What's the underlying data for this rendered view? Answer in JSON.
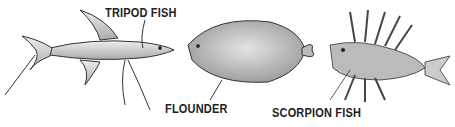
{
  "figure": {
    "fish": [
      {
        "id": "tripod",
        "label": "TRIPOD FISH"
      },
      {
        "id": "flounder",
        "label": "FLOUNDER"
      },
      {
        "id": "scorpion",
        "label": "SCORPION FISH"
      }
    ]
  }
}
